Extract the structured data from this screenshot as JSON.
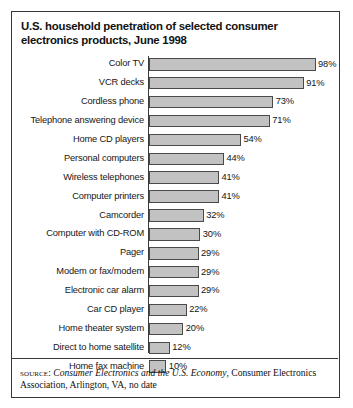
{
  "figure": {
    "number_label": "FIGURE 4.2"
  },
  "title": "U.S. household penetration of selected consumer electronics products, June 1998",
  "source": {
    "label": "source:",
    "publication": "Consumer Electronics and the U.S. Economy",
    "rest": ", Consumer Electronics Association, Arlington, VA, no date"
  },
  "colors": {
    "bar_fill": "#c2c2c2",
    "bar_stroke": "#4a4a4a",
    "axis": "#3a3a3a",
    "frame": "#35373a",
    "text": "#141414"
  },
  "chart_data": {
    "type": "bar",
    "orientation": "horizontal",
    "title": "U.S. household penetration of selected consumer electronics products, June 1998",
    "xlabel": "",
    "ylabel": "",
    "xlim": [
      0,
      100
    ],
    "grid": false,
    "legend": "none",
    "value_suffix": "%",
    "categories": [
      "Color TV",
      "VCR decks",
      "Cordless phone",
      "Telephone answering device",
      "Home CD players",
      "Personal computers",
      "Wireless telephones",
      "Computer printers",
      "Camcorder",
      "Computer with CD-ROM",
      "Pager",
      "Modem or fax/modem",
      "Electronic car alarm",
      "Car CD player",
      "Home theater system",
      "Direct to home satellite",
      "Home fax machine"
    ],
    "values": [
      98,
      91,
      73,
      71,
      54,
      44,
      41,
      41,
      32,
      30,
      29,
      29,
      29,
      22,
      20,
      12,
      10
    ],
    "data_labels": [
      "98%",
      "91%",
      "73%",
      "71%",
      "54%",
      "44%",
      "41%",
      "41%",
      "32%",
      "30%",
      "29%",
      "29%",
      "29%",
      "22%",
      "20%",
      "12%",
      "10%"
    ]
  }
}
